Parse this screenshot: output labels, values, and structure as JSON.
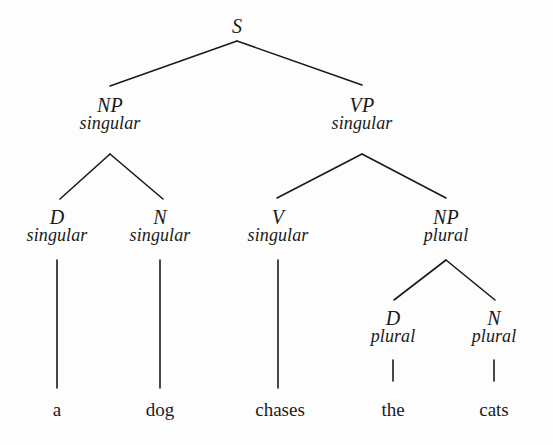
{
  "figure": {
    "kind": "syntax-tree",
    "sentence": "a dog chases the cats",
    "ink_color": "#1a1a1a",
    "background_color": "#fdfdfd"
  },
  "nodes": {
    "s": {
      "category": "S",
      "feature": "",
      "x": 237,
      "y": 16
    },
    "np_subject": {
      "category": "NP",
      "feature": "singular",
      "x": 110,
      "y": 95
    },
    "vp": {
      "category": "VP",
      "feature": "singular",
      "x": 362,
      "y": 95
    },
    "d_singular": {
      "category": "D",
      "feature": "singular",
      "x": 57,
      "y": 207
    },
    "n_singular": {
      "category": "N",
      "feature": "singular",
      "x": 160,
      "y": 207
    },
    "v_singular": {
      "category": "V",
      "feature": "singular",
      "x": 278,
      "y": 207
    },
    "np_object": {
      "category": "NP",
      "feature": "plural",
      "x": 446,
      "y": 207
    },
    "d_plural": {
      "category": "D",
      "feature": "plural",
      "x": 393,
      "y": 308
    },
    "n_plural": {
      "category": "N",
      "feature": "plural",
      "x": 494,
      "y": 308
    }
  },
  "terminals": [
    {
      "word": "a",
      "x": 57,
      "y": 399
    },
    {
      "word": "dog",
      "x": 160,
      "y": 399
    },
    {
      "word": "chases",
      "x": 280,
      "y": 399
    },
    {
      "word": "the",
      "x": 393,
      "y": 399
    },
    {
      "word": "cats",
      "x": 494,
      "y": 399
    }
  ],
  "edges": [
    {
      "name": "s-to-np",
      "x1": 237,
      "y1": 41,
      "x2": 110,
      "y2": 86
    },
    {
      "name": "s-to-vp",
      "x1": 237,
      "y1": 41,
      "x2": 362,
      "y2": 85
    },
    {
      "name": "np-to-d",
      "x1": 110,
      "y1": 154,
      "x2": 60,
      "y2": 199
    },
    {
      "name": "np-to-n",
      "x1": 110,
      "y1": 154,
      "x2": 163,
      "y2": 199
    },
    {
      "name": "vp-to-v",
      "x1": 362,
      "y1": 154,
      "x2": 277,
      "y2": 198
    },
    {
      "name": "vp-to-np",
      "x1": 362,
      "y1": 154,
      "x2": 446,
      "y2": 198
    },
    {
      "name": "npobj-to-d",
      "x1": 446,
      "y1": 260,
      "x2": 394,
      "y2": 300
    },
    {
      "name": "npobj-to-n",
      "x1": 446,
      "y1": 260,
      "x2": 495,
      "y2": 300
    },
    {
      "name": "d-to-a",
      "x1": 57,
      "y1": 260,
      "x2": 57,
      "y2": 388
    },
    {
      "name": "n-to-dog",
      "x1": 160,
      "y1": 260,
      "x2": 160,
      "y2": 388
    },
    {
      "name": "v-to-chases",
      "x1": 278,
      "y1": 260,
      "x2": 278,
      "y2": 388
    },
    {
      "name": "d-to-the",
      "x1": 393,
      "y1": 360,
      "x2": 393,
      "y2": 381
    },
    {
      "name": "n-to-cats",
      "x1": 494,
      "y1": 360,
      "x2": 494,
      "y2": 381
    }
  ]
}
